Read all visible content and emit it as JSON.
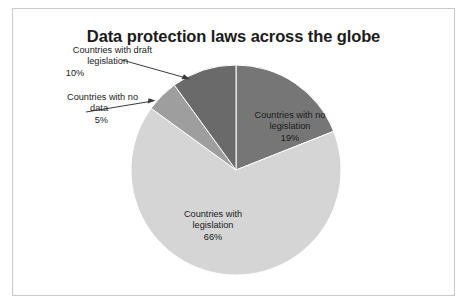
{
  "chart_data": {
    "type": "pie",
    "title": "Data protection laws across the globe",
    "categories": [
      "Countries with no legislation",
      "Countries with legislation",
      "Countries with no data",
      "Countries with draft legislation"
    ],
    "values": [
      19,
      66,
      5,
      10
    ],
    "value_labels": [
      "19%",
      "66%",
      "5%",
      "10%"
    ],
    "unit": "%",
    "start_angle_deg": 0,
    "direction": "clockwise",
    "legend": "none",
    "grid": false,
    "colors": [
      "#767676",
      "#d5d5d5",
      "#9e9e9e",
      "#6a6a6a"
    ],
    "slices": [
      {
        "name": "Countries with no legislation",
        "value": 19,
        "value_label": "19%",
        "color": "#767676",
        "label_placement": "inside",
        "label_line1": "Countries with no",
        "label_line2": "legislation"
      },
      {
        "name": "Countries with legislation",
        "value": 66,
        "value_label": "66%",
        "color": "#d5d5d5",
        "label_placement": "inside",
        "label_line1": "Countries with",
        "label_line2": "legislation"
      },
      {
        "name": "Countries with no data",
        "value": 5,
        "value_label": "5%",
        "color": "#9e9e9e",
        "label_placement": "callout-left",
        "label_line1": "Countries with no",
        "label_line2": "data"
      },
      {
        "name": "Countries with draft legislation",
        "value": 10,
        "value_label": "10%",
        "color": "#6a6a6a",
        "label_placement": "callout-left",
        "label_line1": "Countries with draft",
        "label_line2": "legislation"
      }
    ]
  },
  "title": {
    "text": "Data protection laws across the globe"
  },
  "callouts": {
    "draft": {
      "line1": "Countries with draft",
      "line2": "legislation",
      "percent": "10%"
    },
    "no_data": {
      "line1": "Countries with no",
      "line2": "data",
      "percent": "5%"
    }
  },
  "slice_labels": {
    "no_legislation": {
      "line1": "Countries with no",
      "line2": "legislation",
      "percent": "19%"
    },
    "legislation": {
      "line1": "Countries with",
      "line2": "legislation",
      "percent": "66%"
    }
  },
  "style": {
    "frame_border_color": "#c9c9c9",
    "background": "#ffffff",
    "text_color": "#1b1b1b",
    "arrow_color": "#3a3a3a"
  }
}
